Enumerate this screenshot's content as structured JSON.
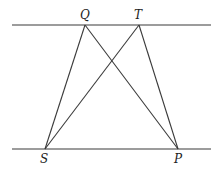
{
  "diagram": {
    "type": "geometry",
    "parallel_lines": [
      {
        "name": "top-line",
        "y": 25,
        "x1": 12,
        "x2": 211
      },
      {
        "name": "bottom-line",
        "y": 149,
        "x1": 12,
        "x2": 211
      }
    ],
    "points": {
      "Q": {
        "label": "Q",
        "x": 85,
        "y": 25
      },
      "T": {
        "label": "T",
        "x": 139,
        "y": 25
      },
      "S": {
        "label": "S",
        "x": 45,
        "y": 149
      },
      "P": {
        "label": "P",
        "x": 178,
        "y": 149
      }
    },
    "segments": [
      [
        "Q",
        "S"
      ],
      [
        "Q",
        "P"
      ],
      [
        "T",
        "S"
      ],
      [
        "T",
        "P"
      ]
    ],
    "colors": {
      "line": "#3a3a3a",
      "background": "#ffffff"
    }
  }
}
